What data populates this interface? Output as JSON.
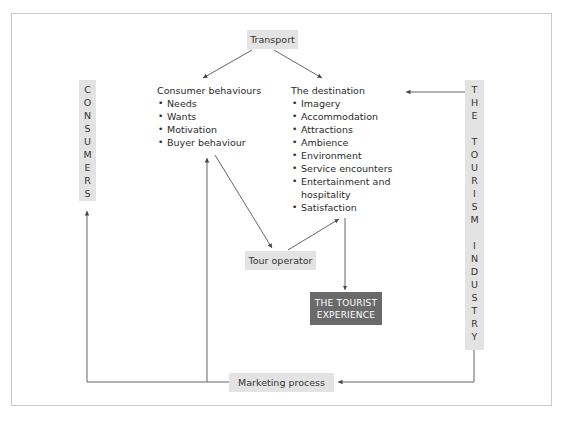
{
  "diagram": {
    "transport": "Transport",
    "consumers_bar": [
      "C",
      "O",
      "N",
      "S",
      "U",
      "M",
      "E",
      "R",
      "S"
    ],
    "tourism_industry_bar": [
      "T",
      "H",
      "E",
      "",
      "T",
      "O",
      "U",
      "R",
      "I",
      "S",
      "M",
      "",
      "I",
      "N",
      "D",
      "U",
      "S",
      "T",
      "R",
      "Y"
    ],
    "consumer_behaviours": {
      "heading": "Consumer behaviours",
      "items": [
        "Needs",
        "Wants",
        "Motivation",
        "Buyer behaviour"
      ]
    },
    "destination": {
      "heading": "The destination",
      "items": [
        "Imagery",
        "Accommodation",
        "Attractions",
        "Ambience",
        "Environment",
        "Service encounters",
        "Entertainment and hospitality",
        "Satisfaction"
      ]
    },
    "tour_operator": "Tour operator",
    "tourist_experience": "THE TOURIST EXPERIENCE",
    "marketing_process": "Marketing process",
    "colors": {
      "light_box": "#e3e3e3",
      "dark_box": "#6a6a6a",
      "line": "#444444",
      "frame": "#c9c9c9"
    }
  }
}
